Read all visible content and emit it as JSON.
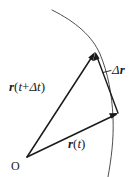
{
  "figure": {
    "background_color": "#ffffff",
    "ink_color": "#1a1a1a",
    "width": 135,
    "height": 177,
    "labels": {
      "position_later": {
        "vector_symbol": "r",
        "argument_open": "(",
        "time": "t",
        "plus": "+",
        "delta": "Δ",
        "delta_time": "t",
        "argument_close": ")",
        "full_text": "r(t+Δt)"
      },
      "position_now": {
        "vector_symbol": "r",
        "argument_open": "(",
        "time": "t",
        "argument_close": ")",
        "full_text": "r(t)"
      },
      "displacement": {
        "delta": "Δ",
        "vector_symbol": "r",
        "full_text": "Δr"
      },
      "origin": {
        "text": "O"
      }
    },
    "geometry": {
      "origin_point": [
        27,
        157
      ],
      "tip_position_later": [
        95,
        52
      ],
      "tip_position_now": [
        118,
        113
      ],
      "curve_start": [
        52,
        10
      ],
      "curve_end": [
        108,
        177
      ],
      "leader_line_start": [
        103,
        72
      ],
      "leader_line_end": [
        111,
        70
      ]
    },
    "elements": {
      "trajectory_curve_name": "trajectory-curve",
      "vector_later_name": "vector-r-t-plus-delta-t",
      "vector_now_name": "vector-r-t",
      "vector_delta_name": "vector-delta-r"
    }
  }
}
